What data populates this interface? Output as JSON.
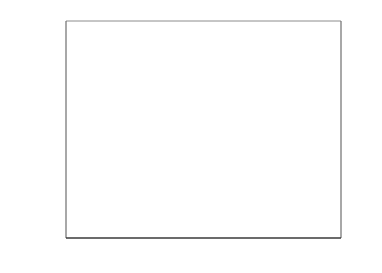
{
  "chart_data": {
    "type": "area",
    "title": "",
    "subtitle": "",
    "xlabel": "",
    "ylabel": "Number of outbreaks",
    "y2label": "",
    "categories": [
      "2007",
      "2008",
      "2009",
      "2010"
    ],
    "x": [
      2007,
      2008,
      2009,
      2010
    ],
    "stacked": true,
    "grid": false,
    "legend": "none",
    "ylim": [
      0,
      2500
    ],
    "y2lim": [
      0,
      250
    ],
    "yticks": [
      "0",
      "500",
      "1000",
      "1500",
      "2000",
      "2500"
    ],
    "ytick_values": [
      0,
      500,
      1000,
      1500,
      2000,
      2500
    ],
    "y2ticks": [
      "0",
      "50",
      "100",
      "150",
      "200",
      "250"
    ],
    "y2tick_values": [
      0,
      50,
      100,
      150,
      200,
      250
    ],
    "xticks": [
      "2007",
      "2008",
      "2009",
      "2010"
    ],
    "series": [
      {
        "name": "dark-series",
        "axis": "left",
        "color": "#1a1a1a",
        "values": [
          20,
          60,
          230,
          60
        ]
      },
      {
        "name": "gray-series",
        "axis": "left",
        "color": "#c8c8c8",
        "values": [
          1980,
          820,
          760,
          650
        ]
      }
    ],
    "cumulative_top": [
      2000,
      880,
      990,
      710
    ],
    "annotations": []
  },
  "style": {
    "plot_border_color": "#7a7a7a",
    "axis_color": "#6e6e6e",
    "gray_fill": "#c8c8c8",
    "dark_fill": "#1a1a1a",
    "background": "#ffffff",
    "text_color": "#2f2f2f"
  }
}
